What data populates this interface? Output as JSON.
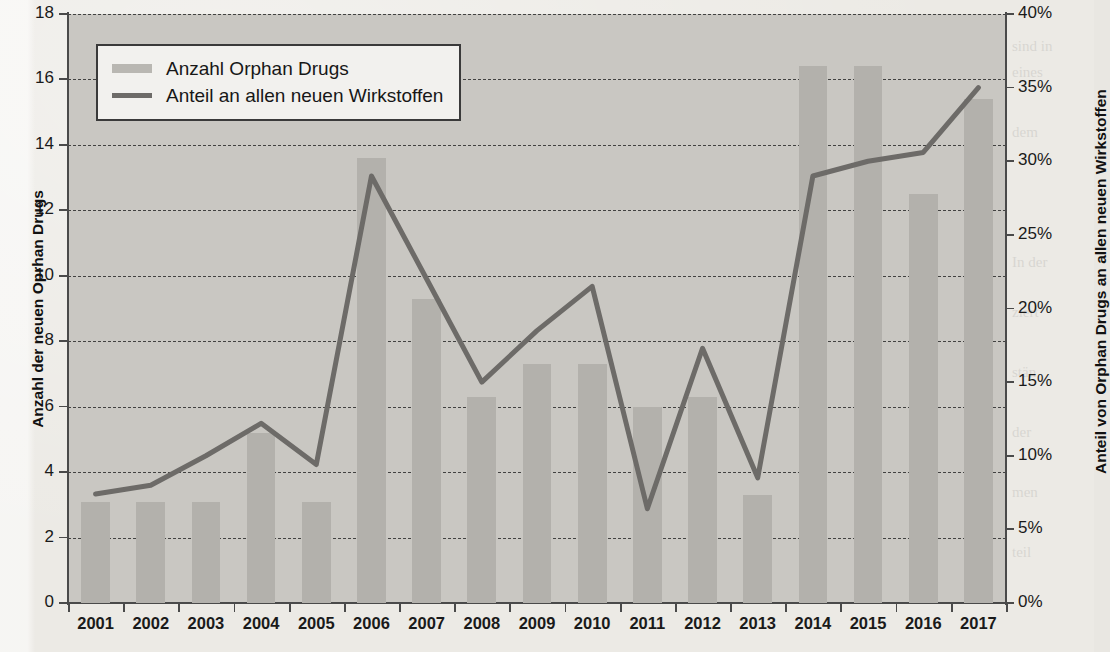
{
  "chart_data": {
    "type": "bar",
    "title": "",
    "categories": [
      "2001",
      "2002",
      "2003",
      "2004",
      "2005",
      "2006",
      "2007",
      "2008",
      "2009",
      "2010",
      "2011",
      "2012",
      "2013",
      "2014",
      "2015",
      "2016",
      "2017"
    ],
    "xlabel": "",
    "grid": true,
    "legend_position": "top-left",
    "series": [
      {
        "name": "Anzahl Orphan Drugs",
        "type": "bar",
        "axis": "left",
        "color": "#b3b1ac",
        "values": [
          3.1,
          3.1,
          3.1,
          5.2,
          3.1,
          13.6,
          9.3,
          6.3,
          7.3,
          7.3,
          6.0,
          6.3,
          3.3,
          16.4,
          16.4,
          12.5,
          15.4
        ]
      },
      {
        "name": "Anteil an allen neuen Wirkstoffen",
        "type": "line",
        "axis": "right",
        "color": "#6d6b68",
        "values": [
          7.4,
          8.0,
          10.0,
          12.2,
          9.4,
          29.0,
          22.0,
          15.0,
          18.5,
          21.5,
          6.4,
          17.3,
          8.5,
          29.0,
          30.0,
          30.6,
          35.0
        ]
      }
    ],
    "left_axis": {
      "title": "Anzahl der neuen Oprhan Drugs",
      "min": 0,
      "max": 18,
      "step": 2,
      "ticks": [
        "0",
        "2",
        "4",
        "6",
        "8",
        "10",
        "12",
        "14",
        "16",
        "18"
      ]
    },
    "right_axis": {
      "title": "Anteil von Orphan Drugs an allen neuen Wirkstoffen",
      "min": 0,
      "max": 40,
      "step": 5,
      "ticks": [
        "0%",
        "5%",
        "10%",
        "15%",
        "20%",
        "25%",
        "30%",
        "35%",
        "40%"
      ]
    }
  },
  "legend": {
    "items": [
      {
        "label": "Anzahl Orphan Drugs",
        "marker": "bar-swatch"
      },
      {
        "label": "Anteil an allen neuen Wirkstoffen",
        "marker": "line-swatch"
      }
    ]
  },
  "page_background": {
    "ghost_lines": [
      "ten dabei eine eigene Zulassung als pharmazeutische",
      "sind in",
      "eines",
      "dem",
      "In der",
      "ziert",
      "stän",
      "der",
      "men",
      "teil"
    ]
  }
}
